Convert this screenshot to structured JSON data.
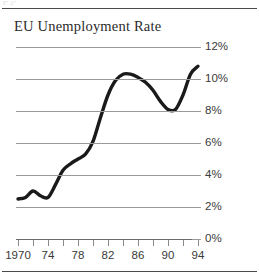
{
  "artifact": {
    "text": "I'' ,i''"
  },
  "figure": {
    "title": "EU Unemployment Rate"
  },
  "chart_data": {
    "type": "line",
    "title": "EU Unemployment Rate",
    "xlabel": "",
    "ylabel": "",
    "xlim": [
      1970,
      1995
    ],
    "ylim": [
      0,
      12
    ],
    "grid": true,
    "legend": null,
    "y_ticks": [
      0,
      2,
      4,
      6,
      8,
      10,
      12
    ],
    "y_tick_labels": [
      "0%",
      "2%",
      "4%",
      "6%",
      "8%",
      "10%",
      "12%"
    ],
    "x_ticks": [
      1970,
      1972,
      1974,
      1976,
      1978,
      1980,
      1982,
      1984,
      1986,
      1988,
      1990,
      1992,
      1994
    ],
    "x_tick_labels": [
      "1970",
      "",
      "74",
      "",
      "78",
      "",
      "82",
      "",
      "86",
      "",
      "90",
      "",
      "94"
    ],
    "x_labeled": [
      {
        "year": 1970,
        "label": "1970"
      },
      {
        "year": 1974,
        "label": "74"
      },
      {
        "year": 1978,
        "label": "78"
      },
      {
        "year": 1982,
        "label": "82"
      },
      {
        "year": 1986,
        "label": "86"
      },
      {
        "year": 1990,
        "label": "90"
      },
      {
        "year": 1994,
        "label": "94"
      }
    ],
    "line_color": "#1a1a1a",
    "grid_color": "#9a9a9a",
    "x": [
      1970,
      1971,
      1972,
      1973,
      1974,
      1975,
      1976,
      1977,
      1978,
      1979,
      1980,
      1981,
      1982,
      1983,
      1984,
      1985,
      1986,
      1987,
      1988,
      1989,
      1990,
      1991,
      1992,
      1993,
      1994
    ],
    "values": [
      2.5,
      2.6,
      3.0,
      2.7,
      2.6,
      3.4,
      4.3,
      4.7,
      5.0,
      5.3,
      6.1,
      7.6,
      9.0,
      9.9,
      10.3,
      10.3,
      10.1,
      9.8,
      9.3,
      8.6,
      8.1,
      8.1,
      9.0,
      10.3,
      10.8
    ]
  }
}
